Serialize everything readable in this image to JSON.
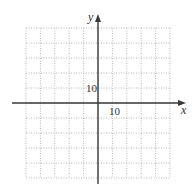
{
  "diagram": {
    "type": "coordinate-grid",
    "axes": {
      "x_label": "x",
      "y_label": "y",
      "x_tick_label": "10",
      "y_tick_label": "10"
    },
    "grid": {
      "columns": 10,
      "rows": 10,
      "cell_value": 10,
      "x_range": [
        -50,
        50
      ],
      "y_range": [
        -50,
        50
      ],
      "line_style": "dotted",
      "line_color": "#b8b8b8",
      "axis_color": "#3a3a3a"
    }
  }
}
